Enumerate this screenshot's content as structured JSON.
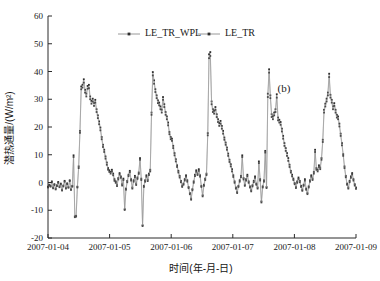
{
  "chart_data": {
    "type": "line",
    "title": "",
    "panel_label": "(b)",
    "xlabel": "时间(年-月-日)",
    "ylabel": "潜热通量/(W/m²)",
    "xlim": [
      "2007-01-04",
      "2007-01-09"
    ],
    "ylim": [
      -20,
      60
    ],
    "xtick_labels": [
      "2007-01-04",
      "2007-01-05",
      "2007-01-06",
      "2007-01-07",
      "2007-01-08",
      "2007-01-09"
    ],
    "ytick_labels": [
      "-20",
      "-10",
      "0",
      "10",
      "20",
      "30",
      "40",
      "50",
      "60"
    ],
    "ytick_values": [
      -20,
      -10,
      0,
      10,
      20,
      30,
      40,
      50,
      60
    ],
    "grid": false,
    "legend_position": "top-center",
    "colors": {
      "line": "#8d8d8d",
      "marker": "#2e2e2e",
      "axis": "#2b2b2b",
      "background": "#ffffff"
    },
    "series": [
      {
        "name": "LE_TR_WPL",
        "marker": "square",
        "values": [
          -1.5,
          -0.8,
          -1.2,
          0.4,
          -1.8,
          -0.6,
          -2.2,
          -1.0,
          0.2,
          -1.4,
          -0.4,
          -2.6,
          -1.1,
          0.6,
          -1.9,
          -0.3,
          -1.6,
          0.8,
          -2.4,
          -1.2,
          9.8,
          -12.2,
          -12.0,
          -1.5,
          5.8,
          18.6,
          34.6,
          35.2,
          37.2,
          33.4,
          32.0,
          34.8,
          35.2,
          31.0,
          29.4,
          30.2,
          28.6,
          29.8,
          26.4,
          24.2,
          22.0,
          19.8,
          16.4,
          13.6,
          11.8,
          9.4,
          7.2,
          5.2,
          4.4,
          3.8,
          4.6,
          3.2,
          1.2,
          0.4,
          -0.8,
          1.6,
          3.4,
          2.2,
          -0.6,
          1.4,
          -9.6,
          -2.2,
          0.6,
          2.8,
          4.2,
          1.2,
          -1.8,
          0.8,
          2.4,
          -0.4,
          1.8,
          3.6,
          8.8,
          1.4,
          -15.4,
          -1.2,
          0.8,
          2.6,
          1.0,
          3.2,
          4.6,
          25.2,
          39.8,
          36.8,
          33.6,
          31.4,
          29.6,
          28.8,
          27.4,
          26.2,
          30.8,
          28.2,
          25.4,
          23.8,
          21.6,
          18.2,
          16.4,
          15.8,
          13.2,
          10.6,
          8.4,
          6.2,
          4.2,
          2.4,
          0.6,
          -1.2,
          -0.4,
          1.2,
          2.6,
          0.8,
          -1.6,
          -3.8,
          -5.8,
          -2.4,
          0.4,
          2.8,
          4.4,
          3.2,
          4.8,
          2.6,
          -1.2,
          -4.6,
          -0.8,
          1.4,
          3.2,
          17.8,
          46.2,
          47.0,
          29.2,
          26.4,
          25.8,
          27.2,
          24.6,
          22.8,
          21.4,
          22.2,
          20.4,
          18.6,
          16.2,
          14.4,
          12.6,
          10.4,
          8.2,
          6.6,
          4.8,
          2.6,
          0.4,
          -1.8,
          -3.4,
          -1.2,
          0.8,
          2.4,
          9.8,
          1.6,
          -0.8,
          1.2,
          2.8,
          0.4,
          -1.4,
          -2.8,
          -1.0,
          0.6,
          2.2,
          -0.4,
          -1.8,
          7.6,
          1.2,
          -6.8,
          -1.4,
          0.8,
          11.4,
          -1.6,
          32.0,
          40.8,
          31.4,
          24.6,
          23.8,
          25.2,
          26.4,
          31.8,
          23.4,
          22.6,
          21.8,
          19.4,
          16.8,
          14.2,
          12.4,
          10.6,
          8.8,
          6.4,
          4.2,
          2.8,
          1.4,
          -0.2,
          -1.6,
          0.4,
          1.8,
          0.6,
          -1.2,
          -2.6,
          -0.8,
          1.2,
          -2.2,
          -3.8,
          -1.4,
          0.8,
          2.6,
          1.4,
          3.8,
          11.8,
          5.2,
          4.6,
          6.2,
          5.4,
          8.8,
          15.4,
          26.2,
          28.4,
          30.2,
          32.4,
          39.2,
          31.6,
          29.8,
          27.4,
          28.6,
          26.2,
          24.4,
          23.8,
          21.2,
          17.6,
          14.2,
          10.2,
          5.8,
          2.4,
          -0.4,
          -1.8,
          0.6,
          2.2,
          3.4,
          1.2,
          -0.6,
          -1.8
        ]
      },
      {
        "name": "LE_TR",
        "marker": "square",
        "values": [
          -1.8,
          -1.1,
          -1.5,
          0.1,
          -2.1,
          -0.9,
          -2.5,
          -1.3,
          -0.1,
          -1.7,
          -0.7,
          -2.9,
          -1.4,
          0.3,
          -2.2,
          -0.6,
          -1.9,
          0.5,
          -2.7,
          -1.5,
          9.2,
          -12.5,
          -12.3,
          -1.8,
          5.2,
          17.9,
          33.6,
          34.2,
          36.0,
          32.4,
          31.0,
          33.8,
          34.0,
          30.0,
          28.4,
          29.2,
          27.6,
          28.8,
          25.4,
          23.2,
          21.0,
          18.8,
          15.6,
          12.8,
          11.0,
          8.6,
          6.4,
          4.6,
          3.8,
          3.2,
          4.0,
          2.6,
          0.6,
          -0.1,
          -1.3,
          1.1,
          2.9,
          1.7,
          -1.1,
          0.9,
          -9.9,
          -2.6,
          0.1,
          2.3,
          3.7,
          0.7,
          -2.2,
          0.3,
          1.9,
          -0.9,
          1.3,
          3.1,
          8.2,
          0.9,
          -15.7,
          -1.6,
          0.3,
          2.1,
          0.5,
          2.7,
          4.0,
          24.4,
          38.6,
          35.6,
          32.6,
          30.4,
          28.6,
          27.8,
          26.4,
          25.2,
          29.8,
          27.2,
          24.4,
          22.8,
          20.6,
          17.4,
          15.6,
          15.0,
          12.4,
          9.8,
          7.6,
          5.6,
          3.6,
          1.8,
          0.1,
          -1.6,
          -0.8,
          0.7,
          2.1,
          0.3,
          -2.0,
          -4.2,
          -6.2,
          -2.8,
          -0.1,
          2.3,
          3.9,
          2.7,
          4.2,
          2.1,
          -1.6,
          -5.0,
          -1.2,
          0.9,
          2.7,
          17.0,
          44.8,
          45.6,
          28.2,
          25.4,
          24.8,
          26.2,
          23.6,
          21.8,
          20.4,
          21.2,
          19.4,
          17.6,
          15.4,
          13.6,
          11.8,
          9.6,
          7.4,
          5.8,
          4.0,
          2.0,
          -0.1,
          -2.2,
          -3.8,
          -1.6,
          0.3,
          1.9,
          9.2,
          1.1,
          -1.2,
          0.7,
          2.3,
          -0.1,
          -1.8,
          -3.2,
          -1.4,
          0.1,
          1.7,
          -0.8,
          -2.2,
          7.0,
          0.7,
          -7.2,
          -1.8,
          0.3,
          10.8,
          -2.0,
          30.8,
          39.6,
          30.4,
          23.6,
          22.8,
          24.2,
          25.4,
          30.6,
          22.4,
          21.6,
          20.8,
          18.4,
          15.8,
          13.2,
          11.4,
          9.6,
          7.8,
          5.6,
          3.6,
          2.2,
          0.9,
          -0.6,
          -2.0,
          -0.1,
          1.3,
          0.1,
          -1.6,
          -3.0,
          -1.2,
          0.7,
          -2.6,
          -4.2,
          -1.8,
          0.3,
          2.1,
          0.9,
          3.2,
          11.0,
          4.6,
          4.0,
          5.6,
          4.8,
          8.2,
          14.6,
          25.2,
          27.4,
          29.2,
          31.4,
          38.0,
          30.6,
          28.8,
          26.4,
          27.6,
          25.2,
          23.4,
          22.8,
          20.2,
          16.8,
          13.4,
          9.6,
          5.2,
          1.9,
          -0.8,
          -2.2,
          0.1,
          1.7,
          2.9,
          0.7,
          -1.1,
          -2.3
        ]
      }
    ],
    "legend": [
      {
        "label": "LE_TR_WPL"
      },
      {
        "label": "LE_TR"
      }
    ]
  }
}
